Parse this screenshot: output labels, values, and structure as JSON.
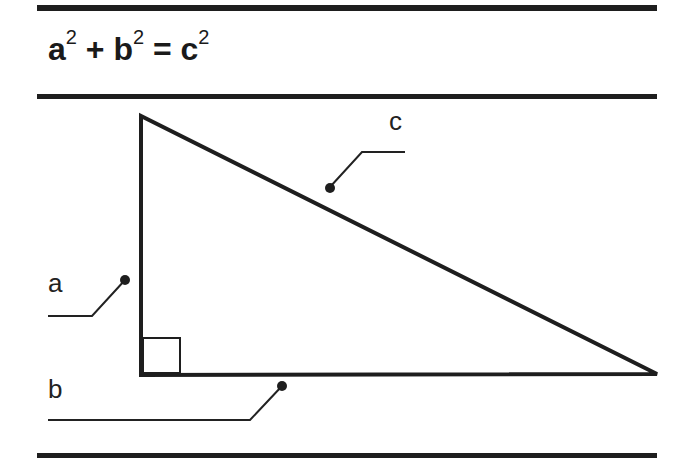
{
  "formula": {
    "a": "a",
    "b": "b",
    "c": "c",
    "exponent": "2",
    "plus": "+",
    "equals": "="
  },
  "triangle": {
    "type": "right-triangle",
    "vertices": {
      "top": [
        141,
        116
      ],
      "right_angle": [
        141,
        375
      ],
      "right": [
        657,
        374
      ]
    },
    "labels": {
      "leg_vertical": "a",
      "leg_horizontal": "b",
      "hypotenuse": "c"
    }
  },
  "colors": {
    "ink": "#1e1e1e",
    "background": "#ffffff"
  }
}
